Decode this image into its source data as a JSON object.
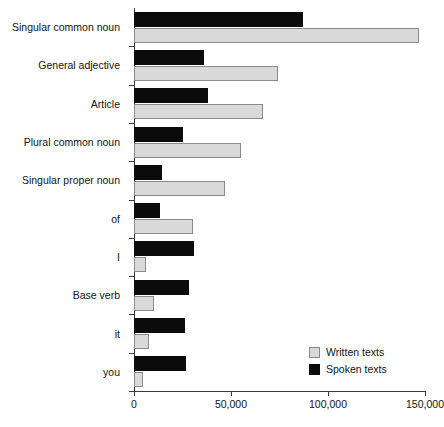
{
  "chart_data": {
    "type": "bar",
    "orientation": "horizontal",
    "title": "",
    "subtitle": "",
    "xlabel": "",
    "ylabel": "",
    "xlim": [
      0,
      150000
    ],
    "grid": false,
    "legend_position": "bottom-right",
    "xticks": [
      0,
      50000,
      100000,
      150000
    ],
    "xtick_labels": [
      "0",
      "50,000",
      "100,000",
      "150,000"
    ],
    "categories": [
      "Singular common noun",
      "General adjective",
      "Article",
      "Plural common noun",
      "Singular proper noun",
      "of",
      "I",
      "Base verb",
      "it",
      "you"
    ],
    "series": [
      {
        "name": "Written texts",
        "color": "#d9d9d9",
        "values": [
          147000,
          74000,
          66500,
          55000,
          47000,
          30500,
          6200,
          10300,
          7700,
          4600
        ]
      },
      {
        "name": "Spoken texts",
        "color": "#0b0b0b",
        "values": [
          87000,
          36000,
          38000,
          25500,
          14500,
          13500,
          31000,
          28500,
          26500,
          27000
        ]
      }
    ]
  },
  "legend": {
    "items": [
      {
        "label": "Written texts",
        "swatch": "written"
      },
      {
        "label": "Spoken texts",
        "swatch": "spoken"
      }
    ]
  }
}
